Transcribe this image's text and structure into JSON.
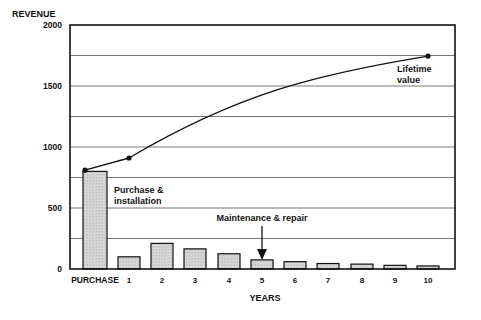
{
  "chart_data": {
    "type": "bar",
    "title": "",
    "ylabel": "REVENUE",
    "xlabel": "YEARS",
    "ylim": [
      0,
      2000
    ],
    "yticks": [
      0,
      500,
      1000,
      1500,
      2000
    ],
    "grid": {
      "horizontal": true,
      "step": 250
    },
    "categories": [
      "PURCHASE",
      "1",
      "2",
      "3",
      "4",
      "5",
      "6",
      "7",
      "8",
      "9",
      "10"
    ],
    "series": [
      {
        "name": "Annual revenue",
        "type": "bar",
        "values": [
          800,
          100,
          210,
          165,
          125,
          75,
          60,
          45,
          40,
          30,
          25
        ]
      },
      {
        "name": "Cumulative revenue",
        "type": "line",
        "points": [
          {
            "x": "PURCHASE",
            "y": 810
          },
          {
            "x": "1",
            "y": 910
          },
          {
            "x": "10",
            "y": 1745
          }
        ]
      }
    ],
    "annotations": [
      {
        "text": "Purchase & installation",
        "target": "PURCHASE"
      },
      {
        "text": "Maintenance & repair",
        "target": "5",
        "arrow": true
      },
      {
        "text": "Lifetime value",
        "target": "10"
      }
    ],
    "colors": {
      "bar_fill": "#d2d2d2",
      "bar_stroke": "#111111",
      "line": "#111111",
      "grid": "#555555"
    }
  },
  "labels": {
    "y_axis_title": "REVENUE",
    "x_axis_title": "YEARS",
    "purchase_note_line1": "Purchase &",
    "purchase_note_line2": "installation",
    "maintenance_note": "Maintenance & repair",
    "lifetime_note_line1": "Lifetime",
    "lifetime_note_line2": "value"
  }
}
